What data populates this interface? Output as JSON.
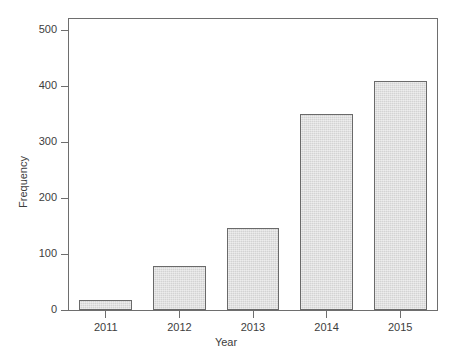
{
  "chart_data": {
    "type": "bar",
    "title": "",
    "subtitle": "",
    "xlabel": "Year",
    "ylabel": "Frequency",
    "categories": [
      "2011",
      "2012",
      "2013",
      "2014",
      "2015"
    ],
    "values": [
      18,
      78,
      147,
      351,
      410
    ],
    "series": [
      {
        "name": "Frequency",
        "values": [
          18,
          78,
          147,
          351,
          410
        ]
      }
    ],
    "xlim": [
      0,
      5
    ],
    "ylim": [
      0,
      520
    ],
    "yticks": [
      0,
      100,
      200,
      300,
      400,
      500
    ],
    "ytick_labels": [
      "0",
      "100",
      "200",
      "300",
      "400",
      "500"
    ],
    "xtick_labels": [
      "2011",
      "2012",
      "2013",
      "2014",
      "2015"
    ],
    "grid": false,
    "legend": false,
    "legend_position": "none",
    "bar_fill_color": "#d9d9d9",
    "bar_border_color": "#6a6a6a",
    "axis_color": "#6e6e6e",
    "text_color": "#3d3d3d",
    "background_color": "#ffffff",
    "annotations": []
  }
}
